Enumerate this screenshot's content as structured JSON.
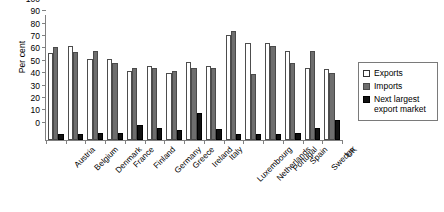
{
  "chart_data": {
    "type": "bar",
    "title": "",
    "subtitle": "",
    "xlabel": "",
    "ylabel": "Per cent",
    "ylim": [
      0,
      100
    ],
    "yticks": [
      0,
      10,
      20,
      30,
      40,
      50,
      60,
      70,
      80,
      90,
      100
    ],
    "grid": false,
    "legend_position": "right",
    "categories": [
      "Austria",
      "Belgium",
      "Denmark",
      "France",
      "Finland",
      "Germany",
      "Greece",
      "Ireland",
      "Italy",
      "Luxembourg",
      "Netherlands",
      "Portugal",
      "Spain",
      "Sweden",
      "UK"
    ],
    "series": [
      {
        "name": "Exports",
        "color": "#ffffff",
        "values": [
          70,
          76,
          65,
          65,
          56,
          60,
          54,
          63,
          60,
          85,
          78,
          78,
          72,
          58,
          57
        ]
      },
      {
        "name": "Imports",
        "color": "#6e6e6e",
        "values": [
          75,
          71,
          72,
          62,
          58,
          58,
          56,
          58,
          58,
          88,
          53,
          76,
          62,
          72,
          54
        ]
      },
      {
        "name": "Next largest export market",
        "color": "#111111",
        "values": [
          5,
          5,
          6,
          6,
          12,
          10,
          8,
          22,
          9,
          5,
          5,
          5,
          6,
          10,
          16
        ]
      }
    ]
  },
  "legend": {
    "items": [
      {
        "label": "Exports",
        "swatch": "exports"
      },
      {
        "label": "Imports",
        "swatch": "imports"
      },
      {
        "label": "Next largest export market",
        "swatch": "nextmkt"
      }
    ]
  }
}
